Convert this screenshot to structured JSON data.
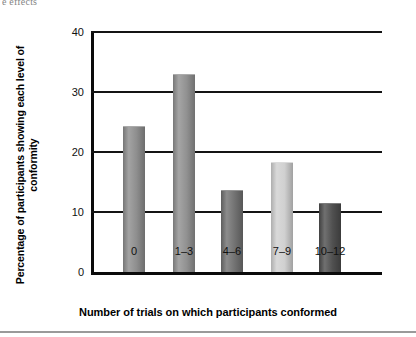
{
  "running_head": "e effects",
  "chart_data": {
    "type": "bar",
    "title": "",
    "xlabel": "Number of trials on which participants conformed",
    "ylabel": "Percentage of participants showing each level of conformity",
    "categories": [
      "0",
      "1–3",
      "4–6",
      "7–9",
      "10–12"
    ],
    "values": [
      24.2,
      32.8,
      13.5,
      18.2,
      11.3
    ],
    "bar_colors": [
      "#8c8c8c",
      "#8f8f8f",
      "#6f6f6f",
      "#cfcfcf",
      "#4c4c4c"
    ],
    "ylim": [
      0,
      40
    ],
    "yticks": [
      0,
      10,
      20,
      30,
      40
    ],
    "ytick_labels": [
      "0",
      "10",
      "20",
      "30",
      "40"
    ],
    "grid": true,
    "grid_axis": "y",
    "legend": false
  }
}
